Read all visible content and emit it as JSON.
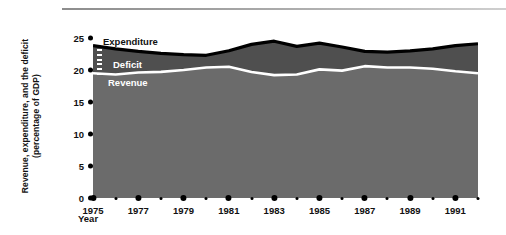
{
  "chart_data": {
    "type": "area",
    "title": "",
    "xlabel": "Year",
    "ylabel": "Revenue, expenditure, and the deficit (percentage of GDP)",
    "ylabel_line1": "Revenue, expenditure, and the deficit",
    "ylabel_line2": "(percentage of GDP)",
    "ylim": [
      0,
      25
    ],
    "xlim": [
      1975,
      1992
    ],
    "grid": false,
    "legend_position": "in-plot-annotations",
    "yticks": [
      25,
      20,
      15,
      10,
      5,
      0
    ],
    "ytick_labels": [
      "25",
      "20",
      "15",
      "10",
      "5",
      "0"
    ],
    "xticks_major": [
      1975,
      1977,
      1979,
      1981,
      1983,
      1985,
      1987,
      1989,
      1991
    ],
    "xtick_major_labels": [
      "1975",
      "1977",
      "1979",
      "1981",
      "1983",
      "1985",
      "1987",
      "1989",
      "1991"
    ],
    "xticks_minor": [
      1976,
      1978,
      1980,
      1982,
      1984,
      1986,
      1988,
      1990,
      1992
    ],
    "x": [
      1975,
      1976,
      1977,
      1978,
      1979,
      1980,
      1981,
      1982,
      1983,
      1984,
      1985,
      1986,
      1987,
      1988,
      1989,
      1990,
      1991,
      1992
    ],
    "series": [
      {
        "name": "Expenditure",
        "color": "#000000",
        "values": [
          23.8,
          23.3,
          22.9,
          22.6,
          22.4,
          22.3,
          23.0,
          24.0,
          24.5,
          23.7,
          24.2,
          23.6,
          22.9,
          22.8,
          23.0,
          23.3,
          23.8,
          24.1
        ]
      },
      {
        "name": "Revenue",
        "color": "#ffffff",
        "values": [
          19.5,
          19.3,
          19.6,
          19.7,
          20.0,
          20.4,
          20.5,
          19.7,
          19.2,
          19.3,
          20.1,
          19.9,
          20.6,
          20.4,
          20.4,
          20.2,
          19.8,
          19.5
        ]
      },
      {
        "name": "Deficit",
        "color": "#555555",
        "values": [
          4.3,
          4.0,
          3.3,
          2.9,
          2.4,
          1.9,
          2.5,
          4.3,
          5.3,
          4.4,
          4.1,
          3.7,
          2.3,
          2.4,
          2.6,
          3.1,
          4.0,
          4.6
        ]
      }
    ],
    "labels": {
      "expenditure": "Expenditure",
      "deficit": "Deficit",
      "revenue": "Revenue"
    },
    "colors": {
      "fill_revenue": "#6b6b6b",
      "fill_deficit": "#4f4f4f",
      "expenditure_line": "#000000",
      "revenue_line": "#ffffff",
      "background": "#ffffff",
      "text": "#111111"
    }
  }
}
